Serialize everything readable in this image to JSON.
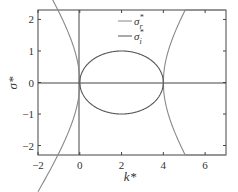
{
  "chart_data": {
    "type": "line",
    "title": "",
    "xlabel": "k*",
    "ylabel": "σ*",
    "xlim": [
      -2,
      7
    ],
    "ylim": [
      -2.3,
      2.3
    ],
    "xticks": [
      -2,
      0,
      2,
      4,
      6
    ],
    "yticks": [
      -2,
      -1,
      0,
      1,
      2
    ],
    "xtick_labels": [
      "−2",
      "0",
      "2",
      "4",
      "6"
    ],
    "ytick_labels": [
      "−2",
      "−1",
      "0",
      "1",
      "2"
    ],
    "grid": false,
    "legend_position": "upper center",
    "series": [
      {
        "name": "σr*",
        "description": "Real part: σ = ±sqrt(k(k-4)) for k<=0 and k>=4, zero for 0<k<4",
        "color": "#888888",
        "x": [
          -2,
          -1.5,
          -1,
          -0.5,
          0,
          4,
          4.5,
          5,
          5.5,
          6,
          6.5,
          7
        ],
        "y_upper": [
          1.73,
          1.62,
          1.41,
          1.0,
          0,
          0,
          1.0,
          1.41,
          1.62,
          1.73,
          1.8,
          2.29
        ],
        "y_lower": [
          -1.73,
          -1.62,
          -1.41,
          -1.0,
          0,
          0,
          -1.0,
          -1.41,
          -1.62,
          -1.73,
          -1.8,
          -2.29
        ]
      },
      {
        "name": "σi*",
        "description": "Imaginary part: circle centered at k=2, radius 1 in σ (ellipse), nonzero for 0<k<4",
        "color": "#555555",
        "x": [
          0,
          0.5,
          1,
          1.5,
          2,
          2.5,
          3,
          3.5,
          4
        ],
        "y_upper": [
          0,
          0.66,
          0.87,
          0.97,
          1.0,
          0.97,
          0.87,
          0.66,
          0
        ],
        "y_lower": [
          0,
          -0.66,
          -0.87,
          -0.97,
          -1.0,
          -0.97,
          -0.87,
          -0.66,
          0
        ]
      }
    ]
  },
  "axes": {
    "xlabel": "k*",
    "ylabel": "σ*"
  },
  "legend": {
    "items": [
      {
        "label": "σ",
        "sup": "*",
        "sub": "r"
      },
      {
        "label": "σ",
        "sup": "*",
        "sub": "i"
      }
    ]
  }
}
